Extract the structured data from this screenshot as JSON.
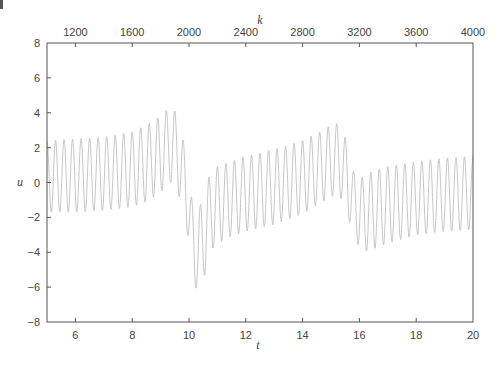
{
  "chart_data": {
    "type": "line",
    "title": "",
    "xlabel": "t",
    "ylabel": "u",
    "x2label": "k",
    "xlim": [
      5,
      20
    ],
    "ylim": [
      -8,
      8
    ],
    "x2lim": [
      1000,
      4000
    ],
    "xticks": [
      6,
      8,
      10,
      12,
      14,
      16,
      18,
      20
    ],
    "x2ticks": [
      1200,
      1600,
      2000,
      2400,
      2800,
      3200,
      3600,
      4000
    ],
    "yticks": [
      -8,
      -6,
      -4,
      -2,
      0,
      2,
      4,
      6,
      8
    ],
    "grid": false,
    "legend": null,
    "line_color": "#b8b8b8",
    "series": [
      {
        "name": "u(t)",
        "description": "Fast oscillation (period ~0.3 in t) with a sawtooth-like envelope; slow drift resets at t~10 and t~15.8",
        "oscillation_period": 0.3,
        "envelope_upper": [
          [
            5.0,
            2.4
          ],
          [
            6.0,
            2.5
          ],
          [
            7.0,
            2.6
          ],
          [
            8.0,
            2.9
          ],
          [
            8.5,
            3.3
          ],
          [
            9.0,
            3.8
          ],
          [
            9.3,
            4.3
          ],
          [
            9.6,
            4.0
          ],
          [
            9.85,
            2.0
          ],
          [
            10.0,
            0.4
          ],
          [
            10.2,
            -2.3
          ],
          [
            10.45,
            -1.0
          ],
          [
            10.8,
            0.8
          ],
          [
            11.3,
            1.1
          ],
          [
            12.0,
            1.5
          ],
          [
            13.0,
            1.9
          ],
          [
            14.0,
            2.4
          ],
          [
            14.6,
            2.9
          ],
          [
            15.0,
            3.3
          ],
          [
            15.3,
            3.4
          ],
          [
            15.6,
            2.2
          ],
          [
            15.8,
            0.6
          ],
          [
            16.1,
            0.3
          ],
          [
            16.5,
            0.7
          ],
          [
            17.0,
            0.9
          ],
          [
            18.0,
            1.2
          ],
          [
            19.0,
            1.4
          ],
          [
            20.0,
            1.5
          ]
        ],
        "envelope_lower": [
          [
            5.0,
            -1.7
          ],
          [
            6.0,
            -1.7
          ],
          [
            7.0,
            -1.6
          ],
          [
            8.0,
            -1.4
          ],
          [
            8.5,
            -1.1
          ],
          [
            9.0,
            -0.6
          ],
          [
            9.3,
            0.1
          ],
          [
            9.6,
            -0.5
          ],
          [
            9.85,
            -2.0
          ],
          [
            10.0,
            -3.5
          ],
          [
            10.2,
            -6.1
          ],
          [
            10.45,
            -5.9
          ],
          [
            10.8,
            -3.8
          ],
          [
            11.3,
            -3.2
          ],
          [
            12.0,
            -2.8
          ],
          [
            13.0,
            -2.4
          ],
          [
            14.0,
            -1.8
          ],
          [
            14.6,
            -1.2
          ],
          [
            15.0,
            -0.8
          ],
          [
            15.3,
            -0.7
          ],
          [
            15.6,
            -2.0
          ],
          [
            15.8,
            -3.1
          ],
          [
            16.1,
            -4.0
          ],
          [
            16.5,
            -3.8
          ],
          [
            17.0,
            -3.5
          ],
          [
            18.0,
            -3.0
          ],
          [
            19.0,
            -2.8
          ],
          [
            20.0,
            -2.7
          ]
        ]
      }
    ]
  },
  "page": {
    "corner_mark": "|"
  }
}
